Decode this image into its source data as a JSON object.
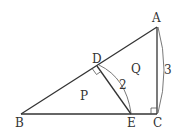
{
  "diagram": {
    "type": "geometry-triangle",
    "points": {
      "A": {
        "label": "A",
        "x": 157,
        "y": 27
      },
      "B": {
        "label": "B",
        "x": 21,
        "y": 114
      },
      "C": {
        "label": "C",
        "x": 157,
        "y": 114
      },
      "D": {
        "label": "D",
        "x": 97,
        "y": 66
      },
      "E": {
        "label": "E",
        "x": 131,
        "y": 114
      }
    },
    "regions": {
      "P": {
        "label": "P"
      },
      "Q": {
        "label": "Q"
      }
    },
    "measures": {
      "DE": "2",
      "AC": "3"
    },
    "right_angles": [
      "D",
      "C"
    ]
  }
}
